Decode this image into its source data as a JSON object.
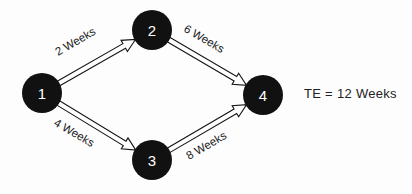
{
  "diagram": {
    "type": "pert-network-diagram",
    "background_color": "#fdfdfd",
    "node_color": "#111111",
    "node_label_color": "#ffffff",
    "edge_color": "#141414",
    "text_color": "#1a1a1a",
    "nodes": [
      {
        "id": "1",
        "label": "1",
        "cx": 42,
        "cy": 93,
        "r": 20
      },
      {
        "id": "2",
        "label": "2",
        "cx": 152,
        "cy": 30,
        "r": 20
      },
      {
        "id": "3",
        "label": "3",
        "cx": 152,
        "cy": 160,
        "r": 20
      },
      {
        "id": "4",
        "label": "4",
        "cx": 263,
        "cy": 95,
        "r": 20
      }
    ],
    "edges": [
      {
        "id": "e-1-2",
        "from": "1",
        "to": "2",
        "label": "2 Weeks",
        "label_x": 58,
        "label_y": 56,
        "label_rotation": -30
      },
      {
        "id": "e-2-4",
        "from": "2",
        "to": "4",
        "label": "6 Weeks",
        "label_x": 183,
        "label_y": 31,
        "label_rotation": 30
      },
      {
        "id": "e-1-3",
        "from": "1",
        "to": "3",
        "label": "4 Weeks",
        "label_x": 53,
        "label_y": 125,
        "label_rotation": 30
      },
      {
        "id": "e-3-4",
        "from": "3",
        "to": "4",
        "label": "8 Weeks",
        "label_x": 189,
        "label_y": 160,
        "label_rotation": -30
      }
    ],
    "annotation": {
      "id": "te-annotation",
      "text": "TE = 12 Weeks"
    }
  }
}
